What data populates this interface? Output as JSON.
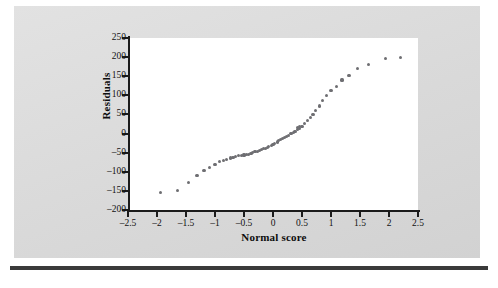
{
  "figure": {
    "background_color": "#dcdcdc",
    "plot_background_color": "#ffffff",
    "point_color": "#6e6e72",
    "axis_color": "#1b1b1b",
    "rule_color": "#3a3a3a"
  },
  "chart_data": {
    "type": "scatter",
    "title": "",
    "subtitle": "",
    "xlabel": "Normal score",
    "ylabel": "Residuals",
    "xlim": [
      -2.5,
      2.5
    ],
    "ylim": [
      -200,
      250
    ],
    "xticks": [
      -2.5,
      -2,
      -1.5,
      -1,
      -0.5,
      0,
      0.5,
      1,
      1.5,
      2,
      2.5
    ],
    "xtick_labels": [
      "–2.5",
      "–2",
      "–1.5",
      "–1",
      "–0.5",
      "0",
      "0.5",
      "1",
      "1.5",
      "2",
      "2.5"
    ],
    "yticks": [
      250,
      200,
      150,
      100,
      50,
      0,
      -50,
      -100,
      -150,
      -200
    ],
    "ytick_labels": [
      "250",
      "200",
      "150",
      "100",
      "50",
      "0",
      "–50",
      "–100",
      "–150",
      "–200"
    ],
    "grid": false,
    "legend": null,
    "annotations": [],
    "marker": "filled-circle",
    "n_points": 62,
    "x": [
      -1.94,
      -1.65,
      -1.46,
      -1.31,
      -1.19,
      -1.09,
      -1.0,
      -0.93,
      -0.86,
      -0.8,
      -0.74,
      -0.69,
      -0.64,
      -0.59,
      -0.55,
      -0.5,
      -0.46,
      -0.42,
      -0.38,
      -0.35,
      -0.31,
      -0.27,
      -0.24,
      -0.2,
      -0.17,
      -0.13,
      -0.1,
      -0.07,
      -0.03,
      0.0,
      0.03,
      0.07,
      0.1,
      0.13,
      0.17,
      0.2,
      0.24,
      0.27,
      0.31,
      0.35,
      0.38,
      0.42,
      0.46,
      0.5,
      0.55,
      0.59,
      0.64,
      0.69,
      0.74,
      0.8,
      0.86,
      0.93,
      1.0,
      1.09,
      1.19,
      1.31,
      1.46,
      1.65,
      1.94,
      2.2,
      0.46,
      0.42
    ],
    "y": [
      -155,
      -148,
      -128,
      -110,
      -97,
      -88,
      -80,
      -74,
      -70,
      -67,
      -64,
      -62,
      -60,
      -58,
      -57,
      -56,
      -55,
      -54,
      -52,
      -50,
      -48,
      -46,
      -44,
      -42,
      -40,
      -38,
      -36,
      -34,
      -31,
      -28,
      -25,
      -22,
      -19,
      -16,
      -13,
      -10,
      -7,
      -4,
      -1,
      2,
      6,
      10,
      14,
      19,
      26,
      33,
      41,
      50,
      60,
      72,
      86,
      100,
      112,
      124,
      140,
      152,
      170,
      180,
      196,
      200,
      18,
      15
    ]
  }
}
